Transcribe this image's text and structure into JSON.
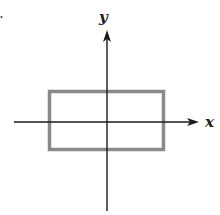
{
  "diagram": {
    "type": "coordinate-plane",
    "axes": {
      "x_label": "x",
      "y_label": "y",
      "origin_px": [
        107,
        122
      ],
      "x_axis": {
        "from": [
          14,
          122
        ],
        "to": [
          198,
          122
        ]
      },
      "y_axis": {
        "from": [
          107,
          211
        ],
        "to": [
          107,
          30
        ]
      }
    },
    "shapes": [
      {
        "type": "rectangle",
        "description": "Rectangle centered near origin, straddling both axes",
        "x": 49,
        "y": 91,
        "width": 115,
        "height": 59,
        "stroke": "#8a8a8a",
        "stroke_width": 3.5,
        "fill": "none"
      }
    ],
    "colors": {
      "axis": "#1a1a1a",
      "rectangle": "#8a8a8a",
      "background": "#ffffff"
    }
  }
}
